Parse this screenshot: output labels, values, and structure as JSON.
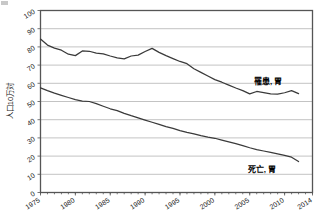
{
  "chart_data": {
    "type": "line",
    "title": "",
    "xlabel": "",
    "ylabel": "人口10万対",
    "xlim": [
      1975,
      2014
    ],
    "ylim": [
      0,
      100
    ],
    "grid": true,
    "legend_position": "inline-right",
    "xticks": [
      "1975",
      "1980",
      "1985",
      "1990",
      "1995",
      "2000",
      "2005",
      "2010",
      "2014"
    ],
    "xtick_values": [
      1975,
      1980,
      1985,
      1990,
      1995,
      2000,
      2005,
      2010,
      2014
    ],
    "yticks": [
      "0",
      "10",
      "20",
      "30",
      "40",
      "50",
      "60",
      "70",
      "80",
      "90",
      "100"
    ],
    "ytick_values": [
      0,
      10,
      20,
      30,
      40,
      50,
      60,
      70,
      80,
      90,
      100
    ],
    "x": [
      1975,
      1976,
      1977,
      1978,
      1979,
      1980,
      1981,
      1982,
      1983,
      1984,
      1985,
      1986,
      1987,
      1988,
      1989,
      1990,
      1991,
      1992,
      1993,
      1994,
      1995,
      1996,
      1997,
      1998,
      1999,
      2000,
      2001,
      2002,
      2003,
      2004,
      2005,
      2006,
      2007,
      2008,
      2009,
      2010,
      2011,
      2012
    ],
    "series": [
      {
        "name": "罹患，胃",
        "label": "罹患, 胃",
        "color": "#3a3a3a",
        "label_x": 2005.6,
        "label_y": 59.5,
        "values": [
          84.3,
          81.0,
          79.3,
          78.2,
          76.0,
          75.2,
          77.8,
          77.6,
          76.6,
          76.2,
          75.0,
          74.0,
          73.4,
          75.0,
          75.5,
          77.5,
          79.2,
          77.0,
          75.2,
          73.6,
          72.0,
          70.8,
          68.0,
          66.0,
          64.0,
          62.0,
          60.6,
          59.0,
          57.4,
          56.0,
          54.2,
          55.5,
          54.9,
          54.2,
          54.0,
          54.8,
          56.0,
          54.3
        ]
      },
      {
        "name": "死亡，胃",
        "label": "死亡, 胃",
        "color": "#3a3a3a",
        "label_x": 2004.7,
        "label_y": 11.5,
        "values": [
          57.5,
          56.0,
          54.6,
          53.4,
          52.2,
          51.0,
          50.2,
          50.0,
          48.8,
          47.4,
          46.0,
          45.0,
          43.5,
          42.2,
          41.0,
          39.8,
          38.6,
          37.4,
          36.2,
          35.2,
          34.0,
          33.0,
          32.2,
          31.2,
          30.4,
          29.8,
          28.8,
          27.8,
          26.8,
          25.8,
          24.6,
          23.6,
          22.8,
          22.0,
          21.2,
          20.4,
          19.4,
          17.0
        ]
      }
    ]
  }
}
